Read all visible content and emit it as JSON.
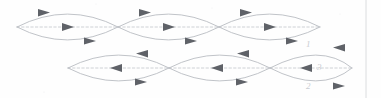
{
  "figure": {
    "background_color": "#fefefe",
    "stroke_color": "#b9bcc2",
    "axis_color": "#c3c6cb",
    "arrow_color": "#5f6268",
    "annotation_color": "#c9ccd1",
    "margin_rule_color": "#d8dadd",
    "width": 381,
    "height": 98
  },
  "geometry": {
    "lens_width": 101,
    "lens_half_height": 20,
    "top_row_axis_y": 27,
    "bottom_row_axis_y": 68,
    "top_row_start_x": 17,
    "bottom_row_start_x": 68,
    "margin_rule_x": 366
  },
  "rows": [
    {
      "id": "top-row",
      "label": "Top row",
      "axis_y": 27,
      "start_x": 17,
      "cells": [
        {
          "id": "top-cell-1",
          "label": "1",
          "left_x": 17,
          "right_x": 118
        },
        {
          "id": "top-cell-2",
          "label": "2",
          "left_x": 118,
          "right_x": 219
        },
        {
          "id": "top-cell-3",
          "label": "3",
          "left_x": 219,
          "right_x": 320
        }
      ],
      "flow": {
        "upper_arc": "right",
        "axis": "right",
        "lower_arc": "right"
      }
    },
    {
      "id": "bottom-row",
      "label": "Bottom row",
      "axis_y": 68,
      "start_x": 68,
      "cells": [
        {
          "id": "bottom-cell-1",
          "label": "1",
          "left_x": 68,
          "right_x": 169
        },
        {
          "id": "bottom-cell-2",
          "label": "2",
          "left_x": 169,
          "right_x": 270
        },
        {
          "id": "bottom-cell-3",
          "label": "3",
          "left_x": 270,
          "right_x": 352
        }
      ],
      "flow": {
        "upper_arc": "left",
        "axis": "left",
        "lower_arc": "right"
      }
    }
  ],
  "annotations": [
    {
      "id": "annot-1",
      "text": "1",
      "x": 306,
      "y": 47
    },
    {
      "id": "annot-3",
      "text": "3",
      "x": 317,
      "y": 70
    },
    {
      "id": "annot-2",
      "text": "2",
      "x": 306,
      "y": 89
    }
  ]
}
